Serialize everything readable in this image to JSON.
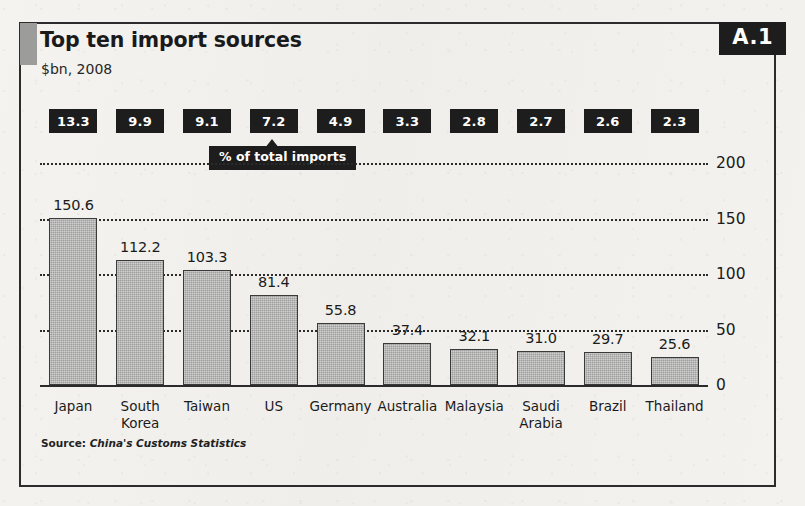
{
  "figure": {
    "badge": "A.1",
    "title": "Top ten import sources",
    "subtitle": "$bn, 2008",
    "source_prefix": "Source:",
    "source_name": "China's Customs Statistics",
    "callout": "% of total imports"
  },
  "chart_data": {
    "type": "bar",
    "title": "Top ten import sources",
    "subtitle": "$bn, 2008",
    "xlabel": "",
    "ylabel": "$bn",
    "ylim": [
      0,
      200
    ],
    "yticks": [
      "0",
      "50",
      "100",
      "150",
      "200"
    ],
    "ytick_values": [
      0,
      50,
      100,
      150,
      200
    ],
    "grid": true,
    "legend": "none",
    "categories": [
      "Japan",
      "South Korea",
      "Taiwan",
      "US",
      "Germany",
      "Australia",
      "Malaysia",
      "Saudi Arabia",
      "Brazil",
      "Thailand"
    ],
    "values": [
      150.6,
      112.2,
      103.3,
      81.4,
      55.8,
      37.4,
      32.1,
      31.0,
      29.7,
      25.6
    ],
    "value_labels": [
      "150.6",
      "112.2",
      "103.3",
      "81.4",
      "55.8",
      "37.4",
      "32.1",
      "31.0",
      "29.7",
      "25.6"
    ],
    "pct_of_total_imports": [
      13.3,
      9.9,
      9.1,
      7.2,
      4.9,
      3.3,
      2.8,
      2.7,
      2.6,
      2.3
    ],
    "pct_labels": [
      "13.3",
      "9.9",
      "9.1",
      "7.2",
      "4.9",
      "3.3",
      "2.8",
      "2.7",
      "2.6",
      "2.3"
    ],
    "annotation": "% of total imports",
    "annotation_target_index": 5,
    "bar_color": "#9d9d9b",
    "bar_edge_color": "#3a3a3a",
    "label_box_color": "#1d1d1d",
    "label_box_text_color": "#ffffff",
    "source": "China's Customs Statistics"
  }
}
